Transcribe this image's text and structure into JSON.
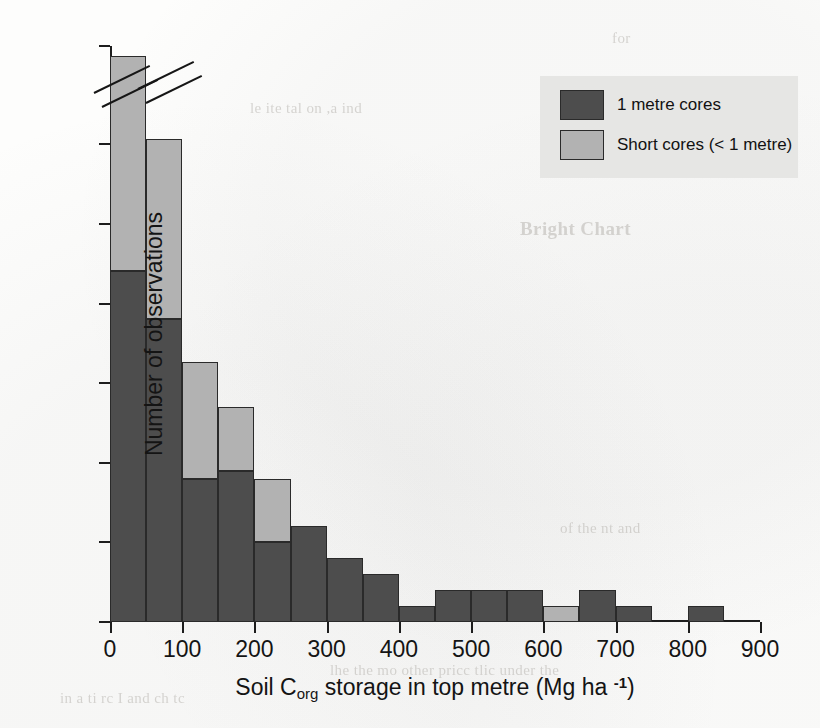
{
  "chart_data": {
    "type": "bar",
    "title": "",
    "xlabel_parts": {
      "pre": "Soil C",
      "sub": "org",
      "mid": " storage in top metre (Mg ha ",
      "sup": "-1",
      "post": ")"
    },
    "xlabel": "Soil Corg storage in top metre (Mg ha -1)",
    "ylabel": "Number of observations",
    "xlim": [
      0,
      900
    ],
    "ylim": [
      0,
      70
    ],
    "y_axis_broken": true,
    "y_break_between": [
      30,
      70
    ],
    "grid": false,
    "legend_position": "top-right",
    "xticks": [
      0,
      100,
      200,
      300,
      400,
      500,
      600,
      700,
      800,
      900
    ],
    "xtick_labels": [
      "0",
      "100",
      "200",
      "300",
      "400",
      "500",
      "600",
      "700",
      "800",
      "900"
    ],
    "yticks": [
      0,
      5,
      10,
      15,
      20,
      25,
      30,
      70
    ],
    "ytick_labels": [
      "0",
      "5",
      "10",
      "15",
      "20",
      "25",
      "30",
      "70"
    ],
    "bin_width": 50,
    "bin_starts": [
      0,
      50,
      100,
      150,
      200,
      250,
      300,
      350,
      400,
      450,
      500,
      550,
      600,
      650,
      700,
      750,
      800
    ],
    "series": [
      {
        "name": "1 metre cores",
        "color": "#4d4d4d",
        "values": [
          22,
          19,
          9,
          9.5,
          5,
          6,
          4,
          3,
          1,
          2,
          2,
          2,
          0,
          2,
          1,
          0,
          1
        ]
      },
      {
        "name": "Short cores (< 1 metre)",
        "color": "#b2b2b2",
        "values": [
          44,
          13,
          7.3,
          4,
          4,
          0,
          0,
          0,
          0,
          0,
          0,
          0,
          1,
          0,
          0,
          0,
          0
        ]
      }
    ],
    "totals": [
      66,
      32,
      16.3,
      13.5,
      9,
      6,
      4,
      3,
      1,
      2,
      2,
      2,
      1,
      2,
      1,
      0,
      1
    ],
    "colors": {
      "dark": "#4d4d4d",
      "light": "#b2b2b2",
      "axis": "#1d1d1d",
      "legend_bg": "#e6e6e4"
    }
  },
  "legend": {
    "entries": [
      {
        "label": "1 metre cores",
        "swatch": "dark"
      },
      {
        "label": "Short cores (< 1 metre)",
        "swatch": "light"
      }
    ]
  },
  "page_background_text": [
    "for",
    "Bright Chart",
    "lhe the  mo  other  pricc  tlic  under the",
    "in a ti  rc  I  and  ch  tc",
    "of the  nt  and",
    "le  ite  tal  on  ,a  ind"
  ]
}
